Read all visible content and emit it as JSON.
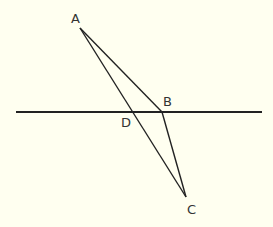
{
  "diagram": {
    "background": "#fffff0",
    "stroke_color": "#222222",
    "points": {
      "A": {
        "label": "A",
        "x": 80,
        "y": 28
      },
      "B": {
        "label": "B",
        "x": 162,
        "y": 112
      },
      "C": {
        "label": "C",
        "x": 186,
        "y": 197
      },
      "D": {
        "label": "D",
        "x": 133,
        "y": 112
      }
    },
    "lines": [
      {
        "name": "horizontal-line",
        "from": [
          16,
          112
        ],
        "to": [
          262,
          112
        ]
      },
      {
        "name": "segment-AB",
        "from": "A",
        "to": "B"
      },
      {
        "name": "segment-BC",
        "from": "B",
        "to": "C"
      },
      {
        "name": "segment-AC",
        "from": "A",
        "to": "C"
      }
    ]
  }
}
